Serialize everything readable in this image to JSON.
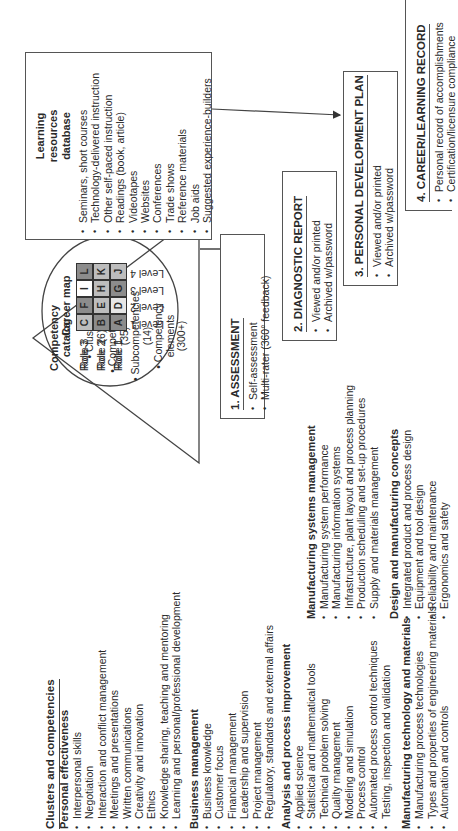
{
  "clusters": {
    "title": "Clusters and competencies",
    "groups": [
      {
        "name": "Personal effectiveness",
        "items": [
          "Interpersonal skills",
          "Negotiation",
          "Interaction and conflict management",
          "Meetings and presentations",
          "Written communications",
          "Creativity and innovation",
          "Ethics",
          "Knowledge sharing, teaching and mentoring",
          "Learning and personal/professional development"
        ]
      },
      {
        "name": "Business management",
        "items": [
          "Business knowledge",
          "Customer focus",
          "Financial management",
          "Leadership and supervision",
          "Project management",
          "Regulatory, standards and external affairs"
        ]
      },
      {
        "name": "Analysis and process improvement",
        "items": [
          "Applied science",
          "Statistical and mathematical tools",
          "Technical problem solving",
          "Quality management",
          "Modeling and simulation",
          "Process control",
          "Automated process control techniques",
          "Testing, inspection and validation"
        ]
      },
      {
        "name": "Manufacturing technology and materials",
        "items": [
          "Manufacturing process technologies",
          "Types and properties of engineering materials",
          "Automation and controls"
        ]
      },
      {
        "name": "Manufacturing systems management",
        "items": [
          "Manufacturing system performance",
          "Manufacturing information systems",
          "Infrastructure, plant layout and process planning",
          "Production scheduling and set-up procedures",
          "Supply and materials management"
        ]
      },
      {
        "name": "Design and manufacturing concepts",
        "items": [
          "Integrated product and process design",
          "Equipment and tool design",
          "Reliability and maintenance",
          "Ergonomics and safety"
        ]
      }
    ]
  },
  "catalog": {
    "title_line1": "Competency",
    "title_line2": "catalog",
    "items": [
      {
        "label": "Clusters",
        "count": "(6)"
      },
      {
        "label": "Competencies",
        "count": "(35)"
      },
      {
        "label": "Subcompetencies",
        "count": "(14)"
      },
      {
        "label_line1": "Competency",
        "label_line2": "elements",
        "count": "(300+)"
      }
    ]
  },
  "career_map": {
    "title": "Career map",
    "roles": [
      "Role 1",
      "Role 2",
      "Role 3"
    ],
    "levels": [
      "Level 1",
      "Level 2",
      "Level 3",
      "Level 4"
    ],
    "grid": [
      [
        "A",
        "B",
        "C"
      ],
      [
        "D",
        "E",
        "F"
      ],
      [
        "G",
        "H",
        "I"
      ],
      [
        "J",
        "K",
        "L"
      ]
    ],
    "shades": [
      [
        "#8c8c8c",
        "#8c8c8c",
        "#bdbdbd"
      ],
      [
        "#e6e6e6",
        "#bdbdbd",
        "#8c8c8c"
      ],
      [
        "#8c8c8c",
        "#bdbdbd",
        "#ffffff"
      ],
      [
        "#bdbdbd",
        "#bdbdbd",
        "#8c8c8c"
      ]
    ]
  },
  "resources": {
    "title_line1": "Learning",
    "title_line2": "resources",
    "title_line3": "database",
    "items": [
      "Seminars, short courses",
      "Technology-delivered instruction",
      "Other self-paced instruction",
      "Readings (book, article)",
      "Videotapes",
      "Websites",
      "Conferences",
      "Trade shows",
      "Reference materials",
      "Job aids",
      "Suggested experience-builders"
    ]
  },
  "steps": [
    {
      "title": "1. ASSESSMENT",
      "items": [
        "Self-assessment",
        "Multi-rater (360° feedback)"
      ]
    },
    {
      "title": "2.  DIAGNOSTIC REPORT",
      "items": [
        "Viewed and/or printed",
        "Archived w/password"
      ]
    },
    {
      "title": "3.  PERSONAL DEVELOPMENT PLAN",
      "items": [
        "Viewed and/or printed",
        "Archived w/password"
      ]
    },
    {
      "title": "4.  CAREER/LEARNING RECORD",
      "items": [
        "Personal record of accomplishments",
        "Certification/licensure compliance"
      ]
    }
  ]
}
